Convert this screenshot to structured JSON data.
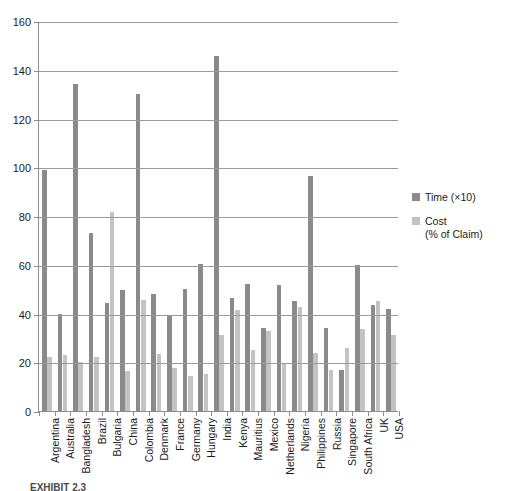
{
  "chart_data": {
    "type": "bar",
    "title": "",
    "xlabel": "",
    "ylabel": "",
    "ylim": [
      0,
      160
    ],
    "ytick_step": 20,
    "yticks": [
      0,
      20,
      40,
      60,
      80,
      100,
      120,
      140,
      160
    ],
    "grid": true,
    "legend_position": "right",
    "categories": [
      "Argentina",
      "Australia",
      "Bangladesh",
      "Brazil",
      "Bulgaria",
      "China",
      "Colombia",
      "Denmark",
      "France",
      "Germany",
      "Hungary",
      "India",
      "Kenya",
      "Mauritius",
      "Mexico",
      "Netherlands",
      "Nigeria",
      "Philippines",
      "Russia",
      "Singapore",
      "South Africa",
      "UK",
      "USA"
    ],
    "series": [
      {
        "name": "Time (×10)",
        "color": "#8a8a8a",
        "values": [
          99,
          40,
          134,
          73,
          44.5,
          49.5,
          130,
          48,
          39.5,
          50,
          60.5,
          145.5,
          46.5,
          52,
          34,
          51.5,
          45,
          96.5,
          34,
          17,
          60,
          43.5,
          42
        ]
      },
      {
        "name": "Cost\n(% of Claim)",
        "color": "#c3c3c3",
        "values": [
          22,
          23,
          20,
          22,
          81.5,
          16.5,
          45.5,
          23.5,
          17.5,
          14.5,
          15,
          31,
          41.5,
          25,
          33,
          19.5,
          42.5,
          24,
          17,
          26,
          33.5,
          45,
          31
        ]
      }
    ]
  },
  "legend": {
    "items": [
      {
        "label": "Time (×10)",
        "swatch": "time"
      },
      {
        "label": "Cost",
        "label2": "(% of Claim)",
        "swatch": "cost"
      }
    ]
  },
  "caption": {
    "text": "EXHIBIT 2.3"
  }
}
